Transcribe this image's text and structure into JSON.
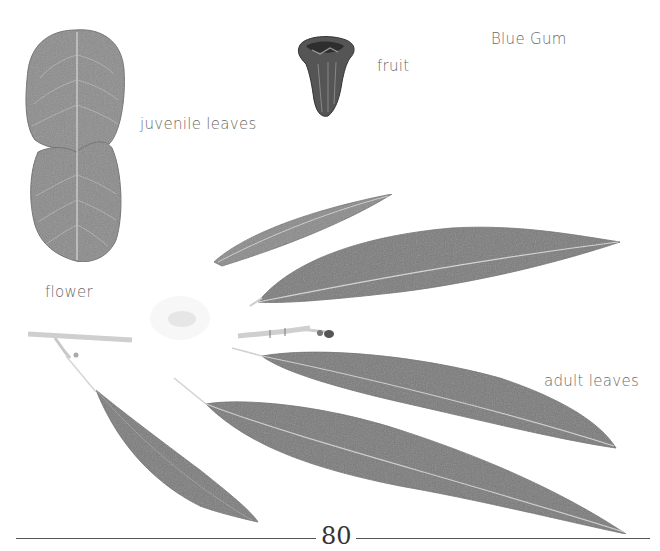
{
  "page": {
    "title": "Blue Gum",
    "page_number": "80"
  },
  "labels": {
    "juvenile_leaves": "juvenile leaves",
    "fruit": "fruit",
    "flower": "flower",
    "adult_leaves": "adult leaves"
  },
  "colors": {
    "leaf_fill": "#8a8a8a",
    "leaf_dark": "#6e6e6e",
    "vein": "#d8d8d8",
    "text": "#6a6a6a",
    "rule": "#555555"
  }
}
